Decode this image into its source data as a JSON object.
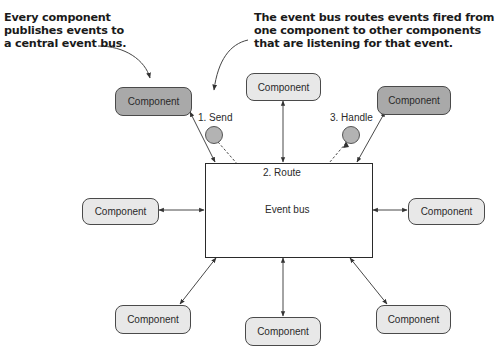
{
  "callouts": {
    "left": {
      "lines": [
        "Every component",
        "publishes events to",
        "a central event bus."
      ]
    },
    "right": {
      "lines": [
        "The event bus routes events fired from",
        "one component to other components",
        "that are listening for that event."
      ]
    }
  },
  "event_bus": {
    "label": "Event bus"
  },
  "steps": {
    "send": "1. Send",
    "route": "2. Route",
    "handle": "3. Handle"
  },
  "components": [
    {
      "id": "top-left",
      "label": "Component",
      "style": "dark"
    },
    {
      "id": "top-center",
      "label": "Component",
      "style": "light"
    },
    {
      "id": "top-right",
      "label": "Component",
      "style": "dark"
    },
    {
      "id": "left",
      "label": "Component",
      "style": "light"
    },
    {
      "id": "right",
      "label": "Component",
      "style": "light"
    },
    {
      "id": "bottom-left",
      "label": "Component",
      "style": "light"
    },
    {
      "id": "bottom-center",
      "label": "Component",
      "style": "light"
    },
    {
      "id": "bottom-right",
      "label": "Component",
      "style": "light"
    }
  ],
  "colors": {
    "component_light": "#e8e8e8",
    "component_dark": "#a9a9a9",
    "event_circle": "#b3b3b3",
    "line": "#3a3a3a"
  }
}
